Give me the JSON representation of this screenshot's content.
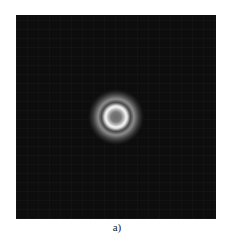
{
  "figure": {
    "caption": "a)",
    "panel": {
      "background_color": "#0d0d0d",
      "description": "Concentric ring (diffraction/interference) pattern on dark background",
      "rings": [
        {
          "name": "center",
          "radius_px": 0,
          "intensity": "medium-gray"
        },
        {
          "name": "inner-bright-ring",
          "radius_px": 10,
          "intensity": "bright-white"
        },
        {
          "name": "dark-gap",
          "radius_px": 14,
          "intensity": "dark-gray"
        },
        {
          "name": "outer-ring",
          "radius_px": 18,
          "intensity": "gray"
        },
        {
          "name": "fade-out",
          "radius_px": 26,
          "intensity": "dark"
        }
      ]
    }
  }
}
